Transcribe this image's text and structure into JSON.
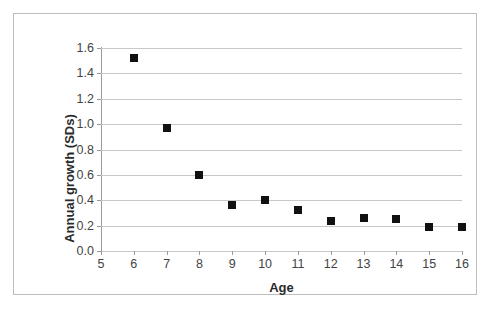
{
  "chart_data": {
    "type": "scatter",
    "title": "",
    "xlabel": "Age",
    "ylabel": "Annual growth (SDs)",
    "x": [
      6,
      7,
      8,
      9,
      10,
      11,
      12,
      13,
      14,
      15,
      16
    ],
    "values": [
      1.52,
      0.97,
      0.6,
      0.36,
      0.4,
      0.32,
      0.24,
      0.26,
      0.25,
      0.19,
      0.19
    ],
    "series": [
      {
        "name": "Annual growth",
        "values": [
          1.52,
          0.97,
          0.6,
          0.36,
          0.4,
          0.32,
          0.24,
          0.26,
          0.25,
          0.19,
          0.19
        ]
      }
    ],
    "xlim": [
      5,
      16
    ],
    "ylim": [
      0.0,
      1.6
    ],
    "x_ticks": [
      5,
      6,
      7,
      8,
      9,
      10,
      11,
      12,
      13,
      14,
      15,
      16
    ],
    "x_tick_labels": [
      "5",
      "6",
      "7",
      "8",
      "9",
      "10",
      "11",
      "12",
      "13",
      "14",
      "15",
      "16"
    ],
    "y_ticks": [
      0.0,
      0.2,
      0.4,
      0.6,
      0.8,
      1.0,
      1.2,
      1.4,
      1.6
    ],
    "y_tick_labels": [
      "0.0",
      "0.2",
      "0.4",
      "0.6",
      "0.8",
      "1.0",
      "1.2",
      "1.4",
      "1.6"
    ],
    "grid": "horizontal",
    "legend": "none",
    "marker": "square",
    "marker_color": "#111111",
    "grid_color": "#c8c8c8",
    "axis_color": "#9a9a9a",
    "background": "#ffffff"
  }
}
